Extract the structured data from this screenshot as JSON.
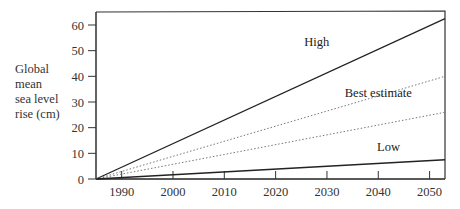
{
  "chart_data": {
    "type": "line",
    "title": "",
    "xlabel": "",
    "ylabel": "Global mean sea level rise (cm)",
    "ylabel_lines": [
      "Global",
      "mean",
      "sea level",
      "rise (cm)"
    ],
    "x_ticks": [
      1990,
      2000,
      2010,
      2020,
      2030,
      2040,
      2050
    ],
    "y_ticks": [
      0,
      10,
      20,
      30,
      40,
      50,
      60
    ],
    "xlim": [
      1985,
      2053
    ],
    "ylim": [
      0,
      65
    ],
    "grid": false,
    "legend": "inline labels",
    "series": [
      {
        "name": "High",
        "style": "solid",
        "x": [
          1985,
          2053
        ],
        "values": [
          0,
          62.5
        ]
      },
      {
        "name": "Best estimate (upper)",
        "style": "dotted",
        "x": [
          1985,
          2053
        ],
        "values": [
          0,
          40
        ]
      },
      {
        "name": "Best estimate (lower)",
        "style": "dotted",
        "x": [
          1985,
          2053
        ],
        "values": [
          0,
          26
        ]
      },
      {
        "name": "Low",
        "style": "solid",
        "x": [
          1985,
          2053
        ],
        "values": [
          0,
          7.5
        ]
      }
    ],
    "annotations": [
      {
        "text": "High",
        "x": 2028,
        "y": 52
      },
      {
        "text": "Best estimate",
        "x": 2040,
        "y": 32
      },
      {
        "text": "Low",
        "x": 2042,
        "y": 11
      }
    ]
  }
}
